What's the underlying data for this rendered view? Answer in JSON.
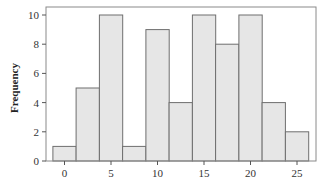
{
  "chart_data": {
    "type": "bar",
    "subtype": "histogram",
    "title": "",
    "xlabel": "",
    "ylabel": "Frequency",
    "bin_width": 2.5,
    "bin_centers": [
      0,
      2.5,
      5,
      7.5,
      10,
      12.5,
      15,
      17.5,
      20,
      22.5,
      25
    ],
    "categories": [
      "0",
      "2.5",
      "5",
      "7.5",
      "10",
      "12.5",
      "15",
      "17.5",
      "20",
      "22.5",
      "25"
    ],
    "values": [
      1,
      5,
      10,
      1,
      9,
      4,
      10,
      8,
      10,
      4,
      2
    ],
    "xlim": [
      -2.0,
      27.5
    ],
    "ylim": [
      0,
      10.6
    ],
    "xticks": [
      0,
      5,
      10,
      15,
      20,
      25
    ],
    "yticks": [
      0,
      2,
      4,
      6,
      8,
      10
    ],
    "grid": false,
    "legend": null,
    "colors": {
      "bar_fill": "#e6e6e6",
      "bar_edge": "#6e6e6e",
      "frame": "#8a8a8a"
    }
  }
}
